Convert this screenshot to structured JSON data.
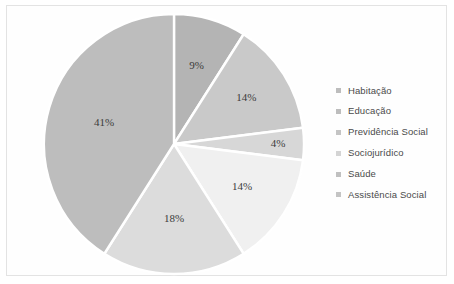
{
  "chart_data": {
    "type": "pie",
    "title": "",
    "subtitle": "",
    "xlabel": "",
    "ylabel": "",
    "legend_position": "right",
    "grid": false,
    "start_angle_oclock": 12,
    "direction": "clockwise",
    "categories": [
      "Habitação",
      "Educação",
      "Previdência Social",
      "Sociojurídico",
      "Saúde",
      "Assistência Social"
    ],
    "values": [
      9,
      14,
      41,
      4,
      14,
      18
    ],
    "value_unit": "%",
    "data_labels": [
      "9%",
      "14%",
      "41%",
      "4%",
      "14%",
      "18%"
    ],
    "slice_colors": [
      "#b4b4b4",
      "#c9c9c9",
      "#bdbdbd",
      "#d7d7d7",
      "#f0f0f0",
      "#dcdcdc"
    ],
    "separator_color": "#ffffff",
    "slices_in_draw_order": [
      {
        "label": "Habitação",
        "value": 9,
        "data_label": "9%",
        "color": "#b4b4b4"
      },
      {
        "label": "Educação",
        "value": 14,
        "data_label": "14%",
        "color": "#c9c9c9"
      },
      {
        "label": "Sociojurídico",
        "value": 4,
        "data_label": "4%",
        "color": "#d7d7d7"
      },
      {
        "label": "Saúde",
        "value": 14,
        "data_label": "14%",
        "color": "#f0f0f0"
      },
      {
        "label": "Assistência Social",
        "value": 18,
        "data_label": "18%",
        "color": "#dcdcdc"
      },
      {
        "label": "Previdência Social",
        "value": 41,
        "data_label": "41%",
        "color": "#bdbdbd"
      }
    ]
  },
  "legend": {
    "marker_icon": "square-marker-icon",
    "items": [
      {
        "label": "Habitação",
        "color": "#bdbdbd"
      },
      {
        "label": "Educação",
        "color": "#bdbdbd"
      },
      {
        "label": "Previdência Social",
        "color": "#c4c4c4"
      },
      {
        "label": "Sociojurídico",
        "color": "#d4d4d4"
      },
      {
        "label": "Saúde",
        "color": "#c0c0c0"
      },
      {
        "label": "Assistência Social",
        "color": "#c4c4c4"
      }
    ]
  },
  "frame": {
    "border_color": "#e3e3e3",
    "background": "#fefefe"
  }
}
